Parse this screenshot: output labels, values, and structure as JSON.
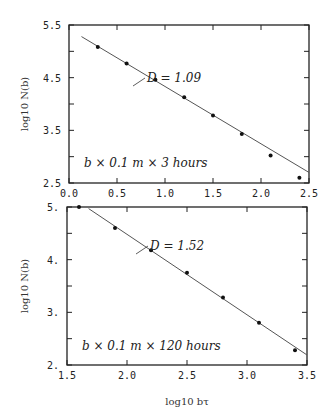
{
  "chart_data": [
    {
      "type": "scatter",
      "title": "",
      "xlabel": "",
      "ylabel": "log10 N(b)",
      "xlim": [
        0.0,
        2.5
      ],
      "ylim": [
        2.5,
        5.5
      ],
      "xticks": [
        "0.0",
        "0.5",
        "1.0",
        "1.5",
        "2.0",
        "2.5"
      ],
      "yticks": [
        "2.5",
        "3.5",
        "4.5",
        "5.5"
      ],
      "annotation_fit": "D = 1.09",
      "annotation_label": "b × 0.1 m × 3 hours",
      "fit_line": {
        "x": [
          0.13,
          2.5
        ],
        "y": [
          5.28,
          2.7
        ]
      },
      "series": [
        {
          "name": "data",
          "x": [
            0.3,
            0.6,
            0.9,
            1.2,
            1.5,
            1.8,
            2.1,
            2.4
          ],
          "y": [
            5.08,
            4.77,
            4.46,
            4.13,
            3.78,
            3.43,
            3.02,
            2.6
          ]
        }
      ],
      "grid": false
    },
    {
      "type": "scatter",
      "title": "",
      "xlabel": "log10 bτ",
      "ylabel": "log10 N(b)",
      "xlim": [
        1.5,
        3.5
      ],
      "ylim": [
        2.0,
        5.0
      ],
      "xticks": [
        "1.5",
        "2.0",
        "2.5",
        "3.0",
        "3.5"
      ],
      "yticks": [
        "2.",
        "3.",
        "4.",
        "5."
      ],
      "annotation_fit": "D = 1.52",
      "annotation_label": "b × 0.1 m × 120 hours",
      "fit_line": {
        "x": [
          1.68,
          3.5
        ],
        "y": [
          4.97,
          2.19
        ]
      },
      "series": [
        {
          "name": "data",
          "x": [
            1.6,
            1.9,
            2.2,
            2.5,
            2.8,
            3.1,
            3.4
          ],
          "y": [
            5.0,
            4.6,
            4.18,
            3.75,
            3.28,
            2.8,
            2.28
          ]
        }
      ],
      "grid": false
    }
  ]
}
